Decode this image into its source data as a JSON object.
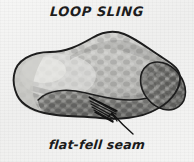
{
  "figure": {
    "title": "LOOP SLING",
    "caption": "flat-fell seam",
    "medium": "grayscale hand-drawn line illustration on paper",
    "background_color": "#f2f2f1",
    "ink_color": "#1d1d1d"
  },
  "annotations": {
    "leader_arrow": {
      "name": "arrow",
      "points_to": "flat-fell seam",
      "from_x": 133,
      "from_y": 134,
      "to_x": 112,
      "to_y": 113
    }
  },
  "illustration": {
    "body_fill": "#bdbdba",
    "body_highlight": "#d7d7d4",
    "roll_fill": "#8f8f8c",
    "roll_end_fill": "#7e7e7b",
    "outline": "#1d1d1d",
    "seam_lines": 5,
    "seam_label": "flat-fell seam"
  }
}
